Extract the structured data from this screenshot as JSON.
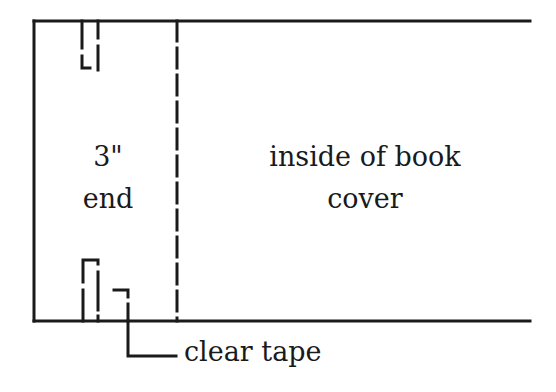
{
  "diagram": {
    "labels": {
      "end_size": "3\"",
      "end_word": "end",
      "cover_line1": "inside of book",
      "cover_line2": "cover",
      "tape": "clear tape"
    },
    "colors": {
      "stroke": "#1a1a1a",
      "background": "#ffffff"
    }
  }
}
